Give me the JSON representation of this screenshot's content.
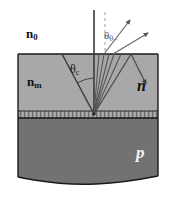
{
  "figure": {
    "labels": {
      "ambient_index": "n",
      "ambient_index_sub": "0",
      "medium_index": "n",
      "medium_index_sub": "m",
      "n_layer": "n",
      "p_layer": "p",
      "theta_zero": "θ",
      "theta_zero_sub": "0",
      "theta_critical": "θ",
      "theta_critical_sub": "c"
    },
    "colors": {
      "background": "#ffffff",
      "upper_layer_fill": "#a8a8a8",
      "junction_band_fill": "#9a9a9a",
      "lower_layer_fill": "#727272",
      "outline": "#1a1a1a",
      "ray_solid": "#4a4a4a",
      "ray_dashed": "#b4b4b4",
      "normal_line": "#3a3a3a",
      "white_text": "#f2f2f2",
      "dark_text": "#111111"
    },
    "geometry": {
      "slab_left_x": 18,
      "slab_right_x": 158,
      "top_surface_y": 54,
      "junction_top_y": 111,
      "junction_bottom_y": 118,
      "bottom_wave_y": 180,
      "emission_point_x": 94,
      "emission_point_y": 114
    },
    "rays": {
      "internal_count": 7,
      "escaping_count": 2,
      "reflected_count": 1,
      "normal_label": "surface-normal",
      "dashed_normal_label": "external-normal"
    }
  }
}
